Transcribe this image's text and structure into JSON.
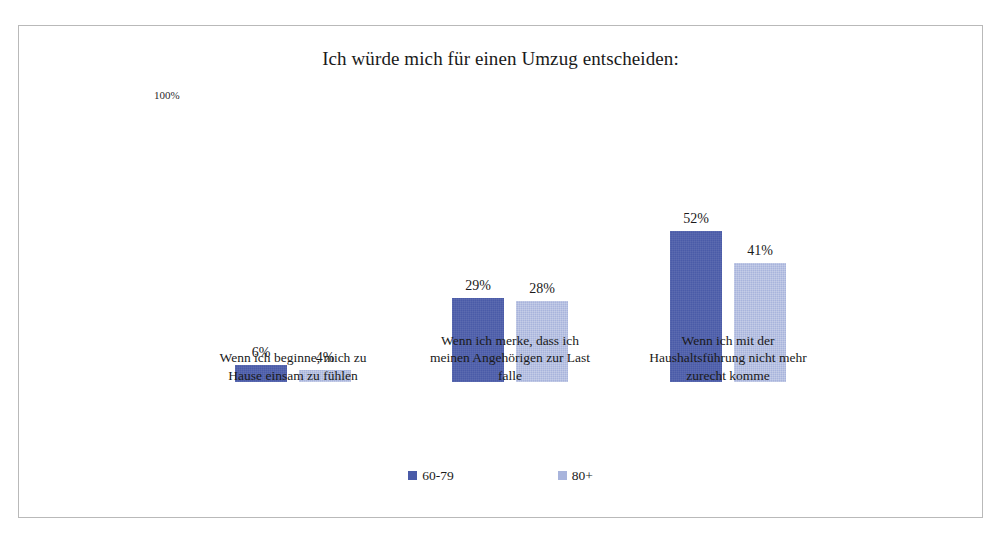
{
  "chart": {
    "title": "Ich würde mich für einen Umzug entscheiden:",
    "axis_max_label": "100%"
  },
  "groups": [
    {
      "label_lines": [
        "Wenn ich beginne, mich zu",
        "Hause einsam zu fühlen"
      ],
      "values": [
        {
          "label": "6%",
          "value": 6
        },
        {
          "label": "4%",
          "value": 4
        }
      ]
    },
    {
      "label_lines": [
        "Wenn ich merke, dass ich",
        "meinen Angehörigen zur Last",
        "falle"
      ],
      "values": [
        {
          "label": "29%",
          "value": 29
        },
        {
          "label": "28%",
          "value": 28
        }
      ]
    },
    {
      "label_lines": [
        "Wenn ich mit der",
        "Haushaltsführung nicht mehr",
        "zurecht komme"
      ],
      "values": [
        {
          "label": "52%",
          "value": 52
        },
        {
          "label": "41%",
          "value": 41
        }
      ]
    }
  ],
  "legend": {
    "items": [
      {
        "label": "60-79",
        "color": "#4a5ba8"
      },
      {
        "label": "80+",
        "color": "#a8b4dc"
      }
    ]
  },
  "chart_data": {
    "type": "bar",
    "title": "Ich würde mich für einen Umzug entscheiden:",
    "subtitle": "",
    "xlabel": "",
    "ylabel": "",
    "ylim": [
      0,
      100
    ],
    "yunit": "%",
    "ytick_labels": [
      "100%"
    ],
    "grid": false,
    "legend_position": "bottom",
    "categories": [
      "Wenn ich beginne, mich zu Hause einsam zu fühlen",
      "Wenn ich merke, dass ich meinen Angehörigen zur Last falle",
      "Wenn ich mit der Haushaltsführung nicht mehr zurecht komme"
    ],
    "series": [
      {
        "name": "60-79",
        "color": "#4a5ba8",
        "values": [
          6,
          29,
          52
        ]
      },
      {
        "name": "80+",
        "color": "#a8b4dc",
        "values": [
          4,
          28,
          41
        ]
      }
    ],
    "data_labels": [
      [
        "6%",
        "29%",
        "52%"
      ],
      [
        "4%",
        "28%",
        "41%"
      ]
    ]
  }
}
